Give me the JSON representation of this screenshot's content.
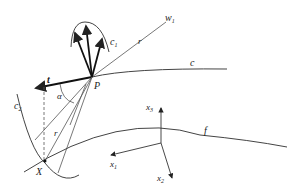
{
  "figure": {
    "labels": {
      "w1": "w",
      "w1_sub": "1",
      "r_upper": "r",
      "c1": "c",
      "c1_sub": "1",
      "c": "c",
      "t": "t",
      "P": "P",
      "alpha": "α",
      "c2": "c",
      "c2_sub": "2",
      "r_lower": "r",
      "X": "X",
      "f": "f",
      "x1": "x",
      "x1_sub": "1",
      "x2": "x",
      "x2_sub": "2",
      "x3": "x",
      "x3_sub": "3"
    },
    "colors": {
      "stroke": "#333333",
      "background": "#ffffff"
    }
  }
}
